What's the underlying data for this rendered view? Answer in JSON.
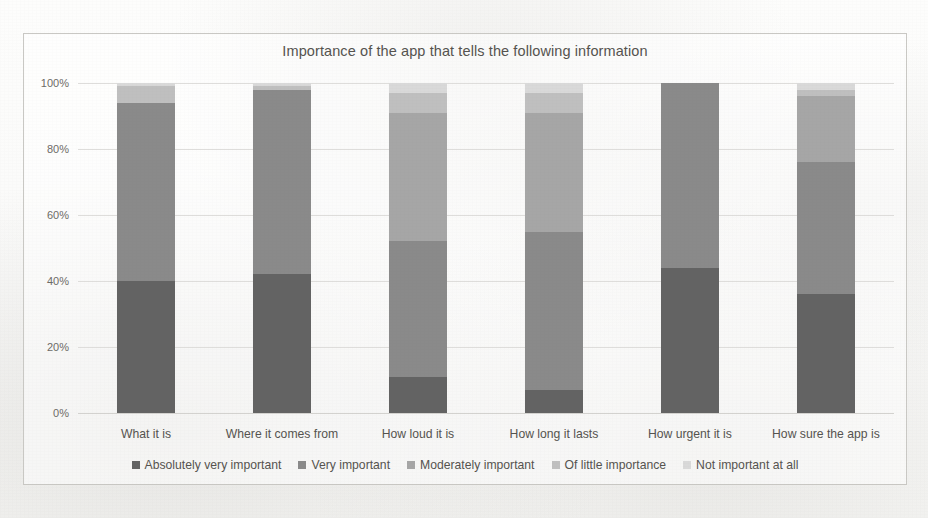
{
  "chart_data": {
    "type": "bar",
    "stacked": true,
    "orientation": "vertical",
    "title": "Importance of the app that tells the following information",
    "xlabel": "",
    "ylabel": "",
    "ylim": [
      0,
      100
    ],
    "ytick_labels": [
      "0%",
      "20%",
      "40%",
      "60%",
      "80%",
      "100%"
    ],
    "ytick_values": [
      0,
      20,
      40,
      60,
      80,
      100
    ],
    "grid": true,
    "legend_position": "bottom",
    "categories": [
      "What it is",
      "Where it comes from",
      "How loud it is",
      "How long it lasts",
      "How urgent it is",
      "How sure the app is"
    ],
    "series": [
      {
        "name": "Absolutely very important",
        "color": "#636363",
        "values": [
          40,
          42,
          11,
          7,
          44,
          36
        ]
      },
      {
        "name": "Very important",
        "color": "#8a8a8a",
        "values": [
          54,
          56,
          41,
          48,
          56,
          40
        ]
      },
      {
        "name": "Moderately important",
        "color": "#a6a6a6",
        "values": [
          0,
          0,
          39,
          36,
          0,
          20
        ]
      },
      {
        "name": "Of little importance",
        "color": "#bfbfbf",
        "values": [
          5,
          1,
          6,
          6,
          0,
          2
        ]
      },
      {
        "name": "Not important at all",
        "color": "#d9d9d9",
        "values": [
          1,
          1,
          3,
          3,
          0,
          2
        ]
      }
    ]
  },
  "legend": {
    "items": [
      {
        "label": "Absolutely very important",
        "color": "#636363"
      },
      {
        "label": "Very important",
        "color": "#8a8a8a"
      },
      {
        "label": "Moderately important",
        "color": "#a6a6a6"
      },
      {
        "label": "Of little importance",
        "color": "#bfbfbf"
      },
      {
        "label": "Not important at all",
        "color": "#d9d9d9"
      }
    ]
  }
}
